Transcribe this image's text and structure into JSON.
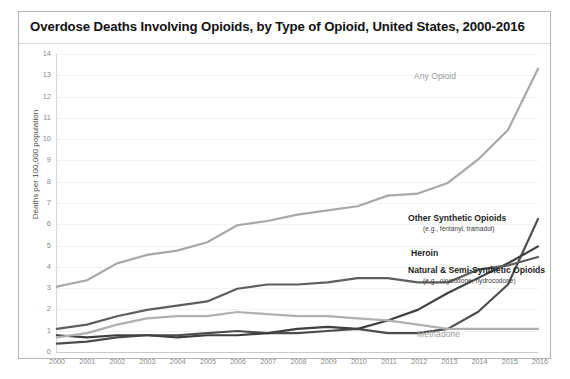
{
  "chart_data": {
    "type": "line",
    "title": "Overdose Deaths Involving Opioids, by Type of Opioid, United States, 2000-2016",
    "xlabel": "",
    "ylabel": "Deaths per 100,000 population",
    "x": [
      2000,
      2001,
      2002,
      2003,
      2004,
      2005,
      2006,
      2007,
      2008,
      2009,
      2010,
      2011,
      2012,
      2013,
      2014,
      2015,
      2016
    ],
    "xtick_labels": [
      "2000",
      "2001",
      "2002",
      "2003",
      "2004",
      "2005",
      "2006",
      "2007",
      "2008",
      "2009",
      "2010",
      "2011",
      "2012",
      "2013",
      "2014",
      "2015",
      "2016"
    ],
    "ytick_labels": [
      "0",
      "1",
      "2",
      "3",
      "4",
      "5",
      "6",
      "7",
      "8",
      "9",
      "10",
      "11",
      "12",
      "13",
      "14"
    ],
    "ylim": [
      0,
      14
    ],
    "xlim": [
      2000,
      2016
    ],
    "grid": true,
    "legend_position": "inline-right",
    "series": [
      {
        "name": "Any Opioid",
        "label": "Any Opioid",
        "sub_label": "",
        "color": "#a8a8a8",
        "values": [
          3.0,
          3.3,
          4.1,
          4.5,
          4.7,
          5.1,
          5.9,
          6.1,
          6.4,
          6.6,
          6.8,
          7.3,
          7.4,
          7.9,
          9.0,
          10.4,
          13.3
        ]
      },
      {
        "name": "Other Synthetic Opioids",
        "label": "Other Synthetic Opioids",
        "sub_label": "(e.g., fentanyl, tramadol)",
        "color": "#4d4d4d",
        "values": [
          0.3,
          0.4,
          0.6,
          0.7,
          0.7,
          0.8,
          0.9,
          0.8,
          0.8,
          0.9,
          1.0,
          0.8,
          0.8,
          1.0,
          1.8,
          3.1,
          6.2
        ]
      },
      {
        "name": "Heroin",
        "label": "Heroin",
        "sub_label": "",
        "color": "#3f3f3f",
        "values": [
          0.7,
          0.6,
          0.7,
          0.7,
          0.6,
          0.7,
          0.7,
          0.8,
          1.0,
          1.1,
          1.0,
          1.4,
          1.9,
          2.7,
          3.4,
          4.1,
          4.9
        ]
      },
      {
        "name": "Natural & Semi-Synthetic Opioids",
        "label": "Natural & Semi-Synthetic Opioids",
        "sub_label": "(e.g., oxycodone, hydrocodone)",
        "color": "#5e5e5e",
        "values": [
          1.0,
          1.2,
          1.6,
          1.9,
          2.1,
          2.3,
          2.9,
          3.1,
          3.1,
          3.2,
          3.4,
          3.4,
          3.2,
          3.2,
          3.8,
          4.0,
          4.4
        ]
      },
      {
        "name": "Methadone",
        "label": "Methadone",
        "sub_label": "",
        "color": "#b0b0b0",
        "values": [
          0.6,
          0.8,
          1.2,
          1.5,
          1.6,
          1.6,
          1.8,
          1.7,
          1.6,
          1.6,
          1.5,
          1.4,
          1.2,
          1.0,
          1.0,
          1.0,
          1.0
        ]
      }
    ]
  },
  "annotations": {
    "any_opioid": {
      "label": "Any Opioid"
    },
    "other_synthetic": {
      "label": "Other Synthetic Opioids",
      "sub": "(e.g., fentanyl, tramadol)"
    },
    "heroin": {
      "label": "Heroin"
    },
    "natural_semi": {
      "label": "Natural & Semi-Synthetic Opioids",
      "sub": "(e.g., oxycodone, hydrocodone)"
    },
    "methadone": {
      "label": "Methadone"
    }
  }
}
